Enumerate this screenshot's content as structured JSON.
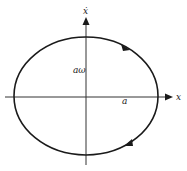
{
  "diagram": {
    "type": "phase-portrait",
    "axes": {
      "horizontal": {
        "label": "x"
      },
      "vertical": {
        "label": "ẋ"
      }
    },
    "annotations": {
      "velocity_amplitude": "aω",
      "position_amplitude": "a"
    },
    "trajectory": {
      "shape": "ellipse",
      "direction": "clockwise",
      "arrow_count": 2
    },
    "colors": {
      "stroke": "#1a1a1a",
      "axis": "#333333",
      "background": "#ffffff"
    }
  }
}
